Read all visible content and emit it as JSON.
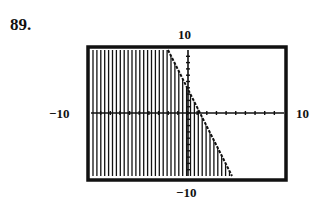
{
  "problem_number": "89.",
  "labels": {
    "ymax": "10",
    "ymin": "−10",
    "xmin": "−10",
    "xmax": "10"
  },
  "chart_data": {
    "type": "area",
    "title": "",
    "window": {
      "xmin": -10,
      "xmax": 10,
      "ymin": -10,
      "ymax": 10
    },
    "xlim": [
      -10,
      10
    ],
    "ylim": [
      -10,
      10
    ],
    "boundary_line": {
      "points": [
        [
          -2,
          10
        ],
        [
          4.5,
          -9
        ]
      ],
      "approx_slope": -3,
      "approx_intercept": 3
    },
    "shading": "below/left of line (vertical hatch)",
    "axes_ticks": "unit tick marks on both axes",
    "grid": false,
    "legend": null
  }
}
